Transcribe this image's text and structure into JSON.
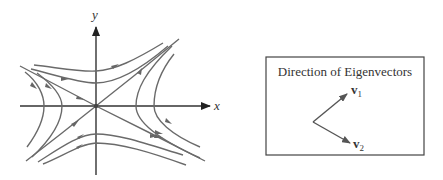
{
  "phase_portrait": {
    "type": "saddle point",
    "x_axis_label": "x",
    "y_axis_label": "y",
    "origin": [
      96,
      106
    ],
    "curve_color": "#6a6a6a",
    "axis_color": "#333333"
  },
  "legend_box": {
    "title": "Direction of Eigenvectors",
    "vectors": [
      {
        "name": "v",
        "subscript": "1",
        "direction": "up-right"
      },
      {
        "name": "v",
        "subscript": "2",
        "direction": "down-right"
      }
    ],
    "border_color": "#444444"
  }
}
